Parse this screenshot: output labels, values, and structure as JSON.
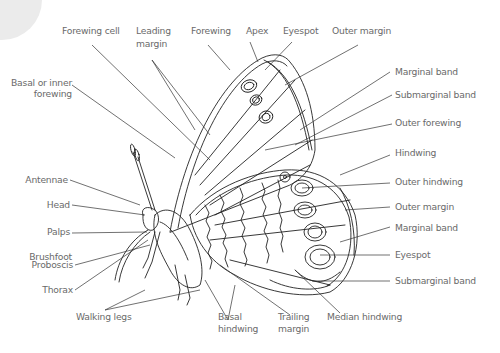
{
  "diagram": {
    "colors": {
      "line": "#222222",
      "label": "#6a6a6a",
      "leader": "#333333",
      "corner_shape": "#ebebeb"
    },
    "labels": {
      "forewing_cell": "Forewing cell",
      "leading_margin_1": "Leading",
      "leading_margin_2": "margin",
      "forewing": "Forewing",
      "apex": "Apex",
      "eyespot_top": "Eyespot",
      "outer_margin_top": "Outer margin",
      "basal_forewing_1": "Basal or inner",
      "basal_forewing_2": "forewing",
      "marginal_band_top": "Marginal band",
      "submarginal_band_top": "Submarginal band",
      "outer_forewing": "Outer forewing",
      "antennae": "Antennae",
      "hindwing": "Hindwing",
      "head": "Head",
      "outer_hindwing": "Outer hindwing",
      "outer_margin_right": "Outer margin",
      "palps": "Palps",
      "brushfoot": "Brushfoot",
      "marginal_band_right": "Marginal band",
      "proboscis": "Proboscis",
      "eyespot_right": "Eyespot",
      "thorax": "Thorax",
      "submarginal_band_right": "Submarginal band",
      "walking_legs": "Walking legs",
      "basal_hindwing_1": "Basal",
      "basal_hindwing_2": "hindwing",
      "trailing_margin_1": "Trailing",
      "trailing_margin_2": "margin",
      "median_hindwing": "Median hindwing"
    }
  }
}
